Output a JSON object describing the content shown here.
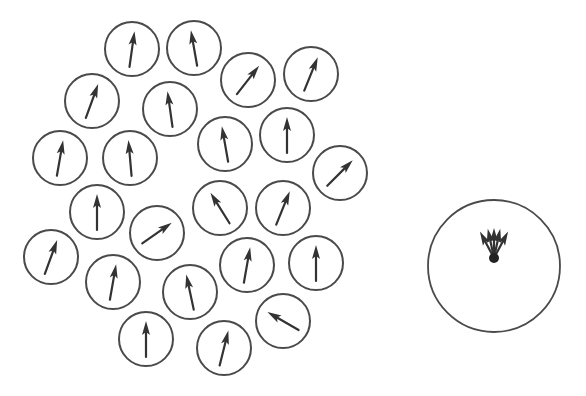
{
  "diagram": {
    "title": "",
    "colors": {
      "stroke": "#4a4a4a",
      "arrow": "#333333",
      "background": "#ffffff"
    },
    "small_circle_radius": 27,
    "arrow_half_length": 18,
    "small_circles": [
      {
        "cx": 132,
        "cy": 49,
        "angle": 8
      },
      {
        "cx": 194,
        "cy": 48,
        "angle": -10
      },
      {
        "cx": 248,
        "cy": 80,
        "angle": 38
      },
      {
        "cx": 311,
        "cy": 74,
        "angle": 22
      },
      {
        "cx": 92,
        "cy": 101,
        "angle": 20
      },
      {
        "cx": 170,
        "cy": 109,
        "angle": -8
      },
      {
        "cx": 60,
        "cy": 158,
        "angle": 10
      },
      {
        "cx": 130,
        "cy": 158,
        "angle": -5
      },
      {
        "cx": 225,
        "cy": 144,
        "angle": -10
      },
      {
        "cx": 287,
        "cy": 135,
        "angle": 0
      },
      {
        "cx": 340,
        "cy": 173,
        "angle": 45
      },
      {
        "cx": 97,
        "cy": 212,
        "angle": 0
      },
      {
        "cx": 157,
        "cy": 233,
        "angle": 55
      },
      {
        "cx": 220,
        "cy": 208,
        "angle": -32
      },
      {
        "cx": 283,
        "cy": 208,
        "angle": 22
      },
      {
        "cx": 51,
        "cy": 257,
        "angle": 20
      },
      {
        "cx": 113,
        "cy": 282,
        "angle": 10
      },
      {
        "cx": 190,
        "cy": 292,
        "angle": -12
      },
      {
        "cx": 247,
        "cy": 265,
        "angle": 10
      },
      {
        "cx": 316,
        "cy": 263,
        "angle": 0
      },
      {
        "cx": 146,
        "cy": 339,
        "angle": 0
      },
      {
        "cx": 224,
        "cy": 348,
        "angle": 14
      },
      {
        "cx": 283,
        "cy": 321,
        "angle": -60
      }
    ],
    "big_circle": {
      "cx": 494,
      "cy": 266,
      "r": 66,
      "origin": {
        "x": 494,
        "y": 258
      },
      "arrow_length": 30,
      "arrow_angles": [
        -28,
        -12,
        0,
        12,
        28
      ]
    }
  }
}
